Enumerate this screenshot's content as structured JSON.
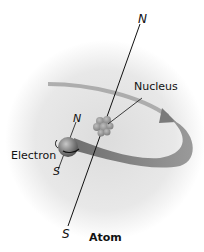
{
  "diagram": {
    "title": "Atom",
    "labels": {
      "axis_north": "N",
      "axis_south": "S",
      "nucleus": "Nucleus",
      "electron": "Electron",
      "electron_north": "N",
      "electron_south": "S"
    },
    "colors": {
      "background_glow": "#d9d9d9",
      "orbit": "#8a8a8a",
      "nucleus": "#9a9a9a",
      "electron": "#6f6f6f",
      "axis": "#111111"
    }
  }
}
